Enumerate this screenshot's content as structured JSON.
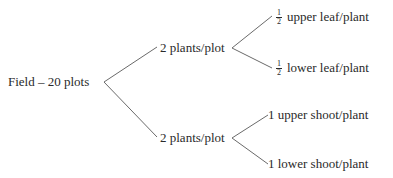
{
  "root": {
    "label": "Field – 20 plots"
  },
  "branches": [
    {
      "label": "2 plants/plot",
      "children": [
        {
          "num": "1",
          "den": "2",
          "label": "upper leaf/plant"
        },
        {
          "num": "1",
          "den": "2",
          "label": "lower leaf/plant"
        }
      ]
    },
    {
      "label": "2 plants/plot",
      "children": [
        {
          "prefix": "1",
          "label": "upper shoot/plant"
        },
        {
          "prefix": "1",
          "label": "lower shoot/plant"
        }
      ]
    }
  ],
  "colors": {
    "line": "#6a6a6a",
    "text": "#2a2a2a"
  }
}
